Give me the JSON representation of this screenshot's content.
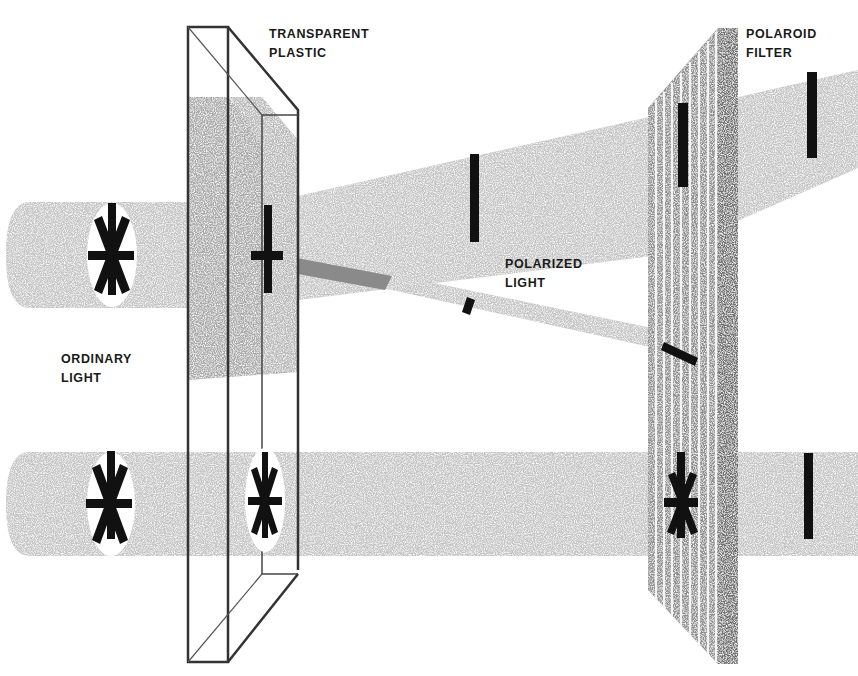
{
  "labels": {
    "transparent_plastic": {
      "line1": "TRANSPARENT",
      "line2": "PLASTIC"
    },
    "polaroid_filter": {
      "line1": "POLAROID",
      "line2": "FILTER"
    },
    "polarized_light": {
      "line1": "POLARIZED",
      "line2": "LIGHT"
    },
    "ordinary_light": {
      "line1": "ORDINARY",
      "line2": "LIGHT"
    }
  },
  "colors": {
    "beam": "#c4c4c4",
    "beam_dark": "#9a9a9a",
    "plastic_shaded": "#a9a9a9",
    "filter": "#8c8c8c",
    "filter_edge": "#6e6e6e",
    "symbol": "#111111",
    "outline": "#333333"
  },
  "components": [
    {
      "name": "upper-ordinary-beam",
      "symbol": "star-of-polarizations"
    },
    {
      "name": "lower-ordinary-beam",
      "symbol": "star-of-polarizations"
    },
    {
      "name": "transparent-plastic-block",
      "state": "upper part stressed (shaded), lower part clear"
    },
    {
      "name": "polarized-beam-upper",
      "symbol": "vertical-bar"
    },
    {
      "name": "polarized-beam-lower",
      "symbol": "tilted-bar"
    },
    {
      "name": "polaroid-filter",
      "symbol": "vertical slats"
    },
    {
      "name": "transmitted-beam-upper",
      "symbol": "vertical-bar"
    },
    {
      "name": "transmitted-beam-lower",
      "symbol": "vertical-bar"
    }
  ]
}
